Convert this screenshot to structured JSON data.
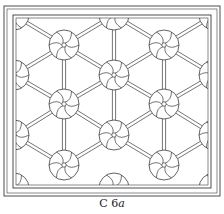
{
  "caption": {
    "label": "C 6",
    "suffix": "a"
  },
  "colors": {
    "line": "#3a3a3a",
    "background": "#ffffff"
  },
  "pattern": {
    "type": "hexagonal lattice grille with pinwheel rosettes",
    "frame": {
      "outer": [
        4,
        6,
        220,
        196
      ],
      "inner": [
        13,
        15,
        211,
        188
      ]
    },
    "rosette_radius": 15,
    "rosettes": [
      [
        14,
        15
      ],
      [
        114,
        15
      ],
      [
        214,
        15
      ],
      [
        64,
        45
      ],
      [
        164,
        45
      ],
      [
        14,
        75
      ],
      [
        114,
        75
      ],
      [
        214,
        75
      ],
      [
        64,
        104
      ],
      [
        164,
        104
      ],
      [
        14,
        135
      ],
      [
        114,
        135
      ],
      [
        214,
        135
      ],
      [
        64,
        165
      ],
      [
        164,
        165
      ],
      [
        14,
        188
      ],
      [
        114,
        188
      ],
      [
        214,
        188
      ]
    ]
  }
}
